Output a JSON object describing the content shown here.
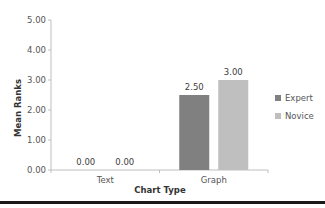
{
  "chart_data": {
    "type": "bar",
    "title": "",
    "xlabel": "Chart Type",
    "ylabel": "Mean Ranks",
    "categories": [
      "Text",
      "Graph"
    ],
    "series": [
      {
        "name": "Expert",
        "values": [
          0.0,
          2.5
        ],
        "color": "#808080"
      },
      {
        "name": "Novice",
        "values": [
          0.0,
          3.0
        ],
        "color": "#bfbfbf"
      }
    ],
    "ylim": [
      0,
      5
    ],
    "yticks": [
      "0.00",
      "1.00",
      "2.00",
      "3.00",
      "4.00",
      "5.00"
    ],
    "data_labels": [
      [
        "0.00",
        "2.50"
      ],
      [
        "0.00",
        "3.00"
      ]
    ],
    "grid": false,
    "legend": "right"
  }
}
